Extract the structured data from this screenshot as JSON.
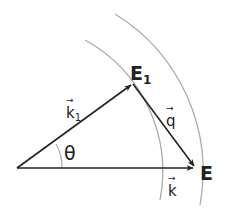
{
  "diagram": {
    "points": {
      "origin": {
        "x": 17,
        "y": 168
      },
      "E1": {
        "x": 133,
        "y": 84
      },
      "E": {
        "x": 195,
        "y": 168
      }
    },
    "labels": {
      "E1_main": "E",
      "E1_sub": "1",
      "E": "E",
      "k1_main": "k",
      "k1_sub": "1",
      "q": "q",
      "k": "k",
      "theta": "θ",
      "vector_arrow": "→"
    },
    "vectors": [
      {
        "name": "k1",
        "from": "origin",
        "to": "E1"
      },
      {
        "name": "q",
        "from": "E1",
        "to": "E"
      },
      {
        "name": "k",
        "from": "origin",
        "to": "E"
      }
    ],
    "arcs": [
      {
        "name": "inner-energy-shell",
        "radius": 145
      },
      {
        "name": "outer-energy-shell",
        "radius": 185
      }
    ],
    "colors": {
      "vector": "#222222",
      "arc": "#aaaaaa",
      "angle_arc": "#999999"
    }
  }
}
